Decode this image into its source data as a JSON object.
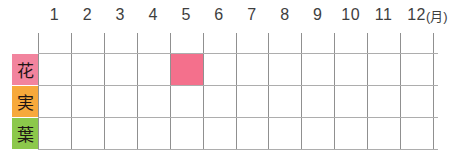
{
  "chart_data": {
    "type": "heatmap",
    "title": "",
    "x_categories": [
      "1",
      "2",
      "3",
      "4",
      "5",
      "6",
      "7",
      "8",
      "9",
      "10",
      "11",
      "12"
    ],
    "x_axis_unit": "(月)",
    "rows": [
      {
        "label": "花",
        "values": [
          0,
          0,
          0,
          0,
          1,
          0,
          0,
          0,
          0,
          0,
          0,
          0
        ]
      },
      {
        "label": "実",
        "values": [
          0,
          0,
          0,
          0,
          0,
          0,
          0,
          0,
          0,
          0,
          0,
          0
        ]
      },
      {
        "label": "葉",
        "values": [
          0,
          0,
          0,
          0,
          0,
          0,
          0,
          0,
          0,
          0,
          0,
          0
        ]
      }
    ],
    "marks": [
      {
        "row": "花",
        "month": 5
      }
    ],
    "legend_position": "none",
    "grid": true
  },
  "calendar": {
    "months": [
      "1",
      "2",
      "3",
      "4",
      "5",
      "6",
      "7",
      "8",
      "9",
      "10",
      "11",
      "12"
    ],
    "unit_label": "(月)",
    "rows": [
      {
        "label": "花",
        "bg_color": "#F2849E"
      },
      {
        "label": "実",
        "bg_color": "#F7A93B"
      },
      {
        "label": "葉",
        "bg_color": "#8CC84B"
      }
    ],
    "marks": [
      {
        "row_index": 0,
        "month": 5,
        "color": "#F4708C"
      }
    ],
    "colors": {
      "background": "#FFFFFF",
      "grid_vertical": "#909090",
      "grid_horizontal": "#ADADAD",
      "header_text": "#3E3E3E",
      "label_text": "#1E1414",
      "mark_fill": "#F4708C"
    }
  }
}
